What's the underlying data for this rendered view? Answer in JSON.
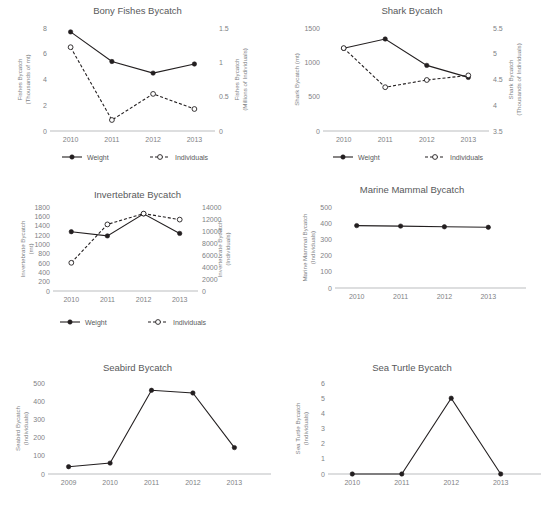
{
  "figure": {
    "panel_count": 6,
    "legend_labels": {
      "weight": "Weight",
      "individuals": "Individuals"
    },
    "colors": {
      "line": "#231f20",
      "text": "#6d6e71",
      "axis": "#bcbec0",
      "background": "#ffffff"
    }
  },
  "chart_data": [
    {
      "type": "line",
      "title": "Bony Fishes Bycatch",
      "xlabel": "",
      "ylabel": "Fishes Bycatch\n(Thousands of mt)",
      "ylabel_line1": "Fishes Bycatch",
      "ylabel_line2": "(Thousands of mt)",
      "y2label_line1": "Fishes Bycatch",
      "y2label_line2": "(Millions of Individuals)",
      "categories": [
        "2010",
        "2011",
        "2012",
        "2013"
      ],
      "ylim": [
        0,
        8
      ],
      "yticks": [
        0,
        2,
        4,
        6,
        8
      ],
      "ytick_labels": [
        "0",
        "2",
        "4",
        "6",
        "8"
      ],
      "y2lim": [
        0,
        1.5
      ],
      "y2ticks": [
        0,
        0.5,
        1,
        1.5
      ],
      "y2tick_labels": [
        "0",
        "0.5",
        "1",
        "1.5"
      ],
      "grid": false,
      "legend": "bottom",
      "series": [
        {
          "name": "Weight",
          "axis": "left",
          "style": "solid",
          "marker": "filled",
          "values": [
            7.7,
            5.4,
            4.5,
            5.2
          ]
        },
        {
          "name": "Individuals",
          "axis": "right",
          "style": "dashed",
          "marker": "open",
          "values": [
            1.22,
            0.16,
            0.54,
            0.32
          ]
        }
      ]
    },
    {
      "type": "line",
      "title": "Shark Bycatch",
      "xlabel": "",
      "ylabel_line1": "Shark Bycatch (mt)",
      "ylabel_line2": "",
      "y2label_line1": "Shark Bycatch",
      "y2label_line2": "(Thousands of Individuals)",
      "categories": [
        "2010",
        "2011",
        "2012",
        "2013"
      ],
      "ylim": [
        0,
        1500
      ],
      "yticks": [
        0,
        500,
        1000,
        1500
      ],
      "ytick_labels": [
        "0",
        "500",
        "1000",
        "1500"
      ],
      "y2lim": [
        3.5,
        5.5
      ],
      "y2ticks": [
        3.5,
        4,
        4.5,
        5,
        5.5
      ],
      "y2tick_labels": [
        "3.5",
        "4",
        "4.5",
        "5",
        "5.5"
      ],
      "grid": false,
      "legend": "bottom",
      "series": [
        {
          "name": "Weight",
          "axis": "left",
          "style": "solid",
          "marker": "filled",
          "values": [
            1205,
            1340,
            955,
            780
          ]
        },
        {
          "name": "Individuals",
          "axis": "right",
          "style": "dashed",
          "marker": "open",
          "values": [
            5.11,
            4.35,
            4.49,
            4.58
          ]
        }
      ]
    },
    {
      "type": "line",
      "title": "Invertebrate Bycatch",
      "xlabel": "",
      "ylabel_line1": "Invertebrate Bycatch",
      "ylabel_line2": "(mt)",
      "y2label_line1": "Invertebrate Bycatch",
      "y2label_line2": "(Individuals)",
      "categories": [
        "2010",
        "2011",
        "2012",
        "2013"
      ],
      "ylim": [
        0,
        1800
      ],
      "yticks": [
        0,
        200,
        400,
        600,
        800,
        1000,
        1200,
        1400,
        1600,
        1800
      ],
      "ytick_labels": [
        "0",
        "200",
        "400",
        "600",
        "800",
        "1000",
        "1200",
        "1400",
        "1600",
        "1800"
      ],
      "y2lim": [
        0,
        14000
      ],
      "y2ticks": [
        0,
        2000,
        4000,
        6000,
        8000,
        10000,
        12000,
        14000
      ],
      "y2tick_labels": [
        "0",
        "2000",
        "4000",
        "6000",
        "8000",
        "10000",
        "12000",
        "14000"
      ],
      "grid": false,
      "legend": "bottom",
      "series": [
        {
          "name": "Weight",
          "axis": "left",
          "style": "solid",
          "marker": "filled",
          "values": [
            1270,
            1180,
            1655,
            1235
          ]
        },
        {
          "name": "Individuals",
          "axis": "right",
          "style": "dashed",
          "marker": "open",
          "values": [
            4700,
            11100,
            12900,
            11900
          ]
        }
      ]
    },
    {
      "type": "line",
      "title": "Marine Mammal Bycatch",
      "xlabel": "",
      "ylabel_line1": "Marine Mammal Bycatch",
      "ylabel_line2": "(Individuals)",
      "categories": [
        "2010",
        "2011",
        "2012",
        "2013"
      ],
      "ylim": [
        0,
        500
      ],
      "yticks": [
        0,
        100,
        200,
        300,
        400,
        500
      ],
      "ytick_labels": [
        "0",
        "100",
        "200",
        "300",
        "400",
        "500"
      ],
      "grid": false,
      "legend": "none",
      "series": [
        {
          "name": "Weight",
          "axis": "left",
          "style": "solid",
          "marker": "filled",
          "values": [
            385,
            382,
            378,
            375
          ]
        }
      ]
    },
    {
      "type": "line",
      "title": "Seabird Bycatch",
      "xlabel": "",
      "ylabel_line1": "Seabird Bycatch",
      "ylabel_line2": "(Individuals)",
      "categories": [
        "2009",
        "2010",
        "2011",
        "2012",
        "2013"
      ],
      "ylim": [
        0,
        500
      ],
      "yticks": [
        0,
        100,
        200,
        300,
        400,
        500
      ],
      "ytick_labels": [
        "0",
        "100",
        "200",
        "300",
        "400",
        "500"
      ],
      "grid": false,
      "legend": "none",
      "series": [
        {
          "name": "Weight",
          "axis": "left",
          "style": "solid",
          "marker": "filled",
          "values": [
            40,
            60,
            460,
            445,
            145
          ]
        }
      ]
    },
    {
      "type": "line",
      "title": "Sea Turtle Bycatch",
      "xlabel": "",
      "ylabel_line1": "Sea Turtle Bycatch",
      "ylabel_line2": "(Individuals)",
      "categories": [
        "2010",
        "2011",
        "2012",
        "2013"
      ],
      "ylim": [
        0,
        6
      ],
      "yticks": [
        0,
        1,
        2,
        3,
        4,
        5,
        6
      ],
      "ytick_labels": [
        "0",
        "1",
        "2",
        "3",
        "4",
        "5",
        "6"
      ],
      "grid": false,
      "legend": "none",
      "series": [
        {
          "name": "Weight",
          "axis": "left",
          "style": "solid",
          "marker": "filled",
          "values": [
            0,
            0,
            5,
            0
          ]
        }
      ]
    }
  ]
}
